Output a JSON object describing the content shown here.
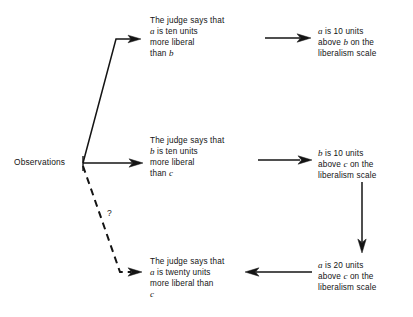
{
  "diagram": {
    "nodes": {
      "observations": {
        "label": "Observations"
      },
      "judge_ab": {
        "line1": "The judge says that",
        "line2_pre": "",
        "line2_var": "a",
        "line2_post": " is ten units",
        "line3": "more liberal",
        "line4_pre": "than ",
        "line4_var": "b",
        "line4_post": ""
      },
      "judge_bc": {
        "line1": "The judge says that",
        "line2_var": "b",
        "line2_post": " is ten units",
        "line3": "more liberal",
        "line4_pre": "than ",
        "line4_var": "c",
        "line4_post": ""
      },
      "judge_ac": {
        "line1": "The judge says that",
        "line2_var": "a",
        "line2_post": " is twenty units",
        "line3": "more liberal than",
        "line4_var": "c",
        "line4_post": ""
      },
      "scale_ab": {
        "line1_var": "a",
        "line1_post": " is 10 units",
        "line2_pre": "above ",
        "line2_var": "b",
        "line2_post": " on the",
        "line3": "liberalism scale"
      },
      "scale_bc": {
        "line1_var": "b",
        "line1_post": " is 10 units",
        "line2_pre": "above ",
        "line2_var": "c",
        "line2_post": " on the",
        "line3": "liberalism scale"
      },
      "scale_ac": {
        "line1_var": "a",
        "line1_post": " is 20 units",
        "line2_pre": "above ",
        "line2_var": "c",
        "line2_post": " on the",
        "line3": "liberalism scale"
      }
    },
    "annotations": {
      "question_mark": "?"
    },
    "edges": [
      {
        "name": "observations-to-judge-ab",
        "style": "solid",
        "arrow": true
      },
      {
        "name": "observations-to-judge-bc",
        "style": "solid",
        "arrow": true
      },
      {
        "name": "observations-to-judge-ac",
        "style": "dashed",
        "arrow": true,
        "label": "?"
      },
      {
        "name": "judge-ab-to-scale-ab",
        "style": "solid",
        "arrow": true
      },
      {
        "name": "judge-bc-to-scale-bc",
        "style": "solid",
        "arrow": true
      },
      {
        "name": "scale-bc-to-scale-ac",
        "style": "solid",
        "arrow": true
      },
      {
        "name": "scale-ac-to-judge-ac",
        "style": "solid",
        "arrow": true
      }
    ],
    "colors": {
      "ink": "#141414",
      "background": "#ffffff"
    }
  }
}
